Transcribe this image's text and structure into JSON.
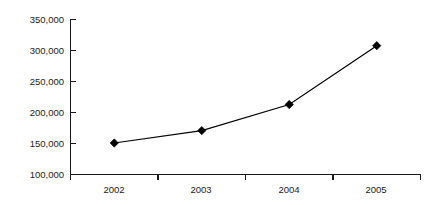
{
  "chart_data": {
    "type": "line",
    "title": "",
    "subtitle": "",
    "xlabel": "",
    "ylabel": "",
    "categories": [
      "2002",
      "2003",
      "2004",
      "2005"
    ],
    "values": [
      150000,
      170000,
      212000,
      307000
    ],
    "series": [
      {
        "name": "",
        "values": [
          150000,
          170000,
          212000,
          307000
        ]
      }
    ],
    "ylim": [
      100000,
      350000
    ],
    "ytick_values": [
      100000,
      150000,
      200000,
      250000,
      300000,
      350000
    ],
    "ytick_labels": [
      "100,000",
      "150,000",
      "200,000",
      "250,000",
      "300,000",
      "350,000"
    ],
    "xtick_labels": [
      "2002",
      "2003",
      "2004",
      "2005"
    ],
    "grid": false,
    "legend": false,
    "legend_position": "none",
    "marker": "diamond",
    "line_color": "#000000",
    "marker_color": "#000000",
    "axis_color": "#1a1a1a",
    "background_color": "#ffffff"
  }
}
